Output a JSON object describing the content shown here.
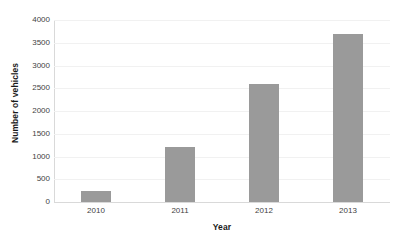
{
  "chart_data": {
    "type": "bar",
    "title": "",
    "subtitle": "",
    "xlabel": "Year",
    "ylabel": "Number of vehicles",
    "categories": [
      "2010",
      "2011",
      "2012",
      "2013"
    ],
    "values": [
      250,
      1200,
      2600,
      3700
    ],
    "series": [
      {
        "name": "Number of vehicles",
        "values": [
          250,
          1200,
          2600,
          3700
        ]
      }
    ],
    "ylim": [
      0,
      4000
    ],
    "ytick_labels": [
      "0",
      "500",
      "1000",
      "1500",
      "2000",
      "2500",
      "3000",
      "3500",
      "4000"
    ],
    "ytick_values": [
      0,
      500,
      1000,
      1500,
      2000,
      2500,
      3000,
      3500,
      4000
    ],
    "grid": true,
    "grid_axis": "y",
    "legend": false,
    "legend_position": "none",
    "bar_color": "#9a9a9a",
    "gridline_color": "#f1f1f1",
    "axis_line_color": "#d9d9d9",
    "background_color": "#ffffff",
    "tick_label_color": "#3f3f3f",
    "axis_title_color": "#1a1a1a",
    "annotations": []
  }
}
